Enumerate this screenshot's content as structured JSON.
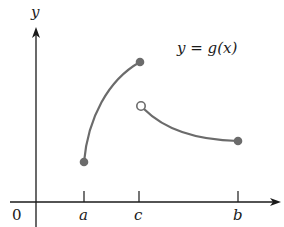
{
  "diagram": {
    "type": "function-graph",
    "function_label": "y = g(x)",
    "axes": {
      "y_label": "y",
      "origin_label": "0",
      "x_ticks": [
        {
          "label": "a",
          "x": 84
        },
        {
          "label": "c",
          "x": 139
        },
        {
          "label": "b",
          "x": 238
        }
      ]
    },
    "curves": [
      {
        "name": "left-piece",
        "from": "a",
        "to": "c",
        "start_endpoint": "closed",
        "end_endpoint": "closed",
        "shape": "increasing concave down"
      },
      {
        "name": "right-piece",
        "from": "c",
        "to": "b",
        "start_endpoint": "open",
        "end_endpoint": "closed",
        "shape": "decreasing concave up"
      }
    ],
    "colors": {
      "axis": "#1a1a1a",
      "curve": "#6b6b6b",
      "point": "#6b6b6b"
    }
  }
}
